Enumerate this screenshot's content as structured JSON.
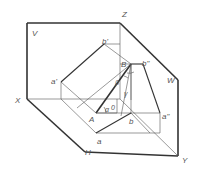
{
  "diagram": {
    "planes": {
      "v": "V",
      "w": "W",
      "h": "H"
    },
    "axes": {
      "x": "X",
      "y": "Y",
      "z": "Z"
    },
    "points": {
      "A": "A",
      "B": "B",
      "a": "a",
      "b": "b",
      "a_prime": "a'",
      "b_prime": "b'",
      "a_double": "a\"",
      "b_double": "b\""
    },
    "angles": {
      "alpha": "α",
      "beta": "β",
      "gamma": "γ",
      "zero": "0"
    },
    "colors": {
      "line": "#333333",
      "thin_line": "#555555",
      "label": "#555555",
      "background": "#ffffff"
    }
  }
}
